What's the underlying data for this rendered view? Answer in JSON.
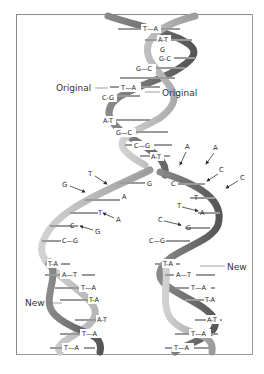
{
  "figure": {
    "labels": {
      "original_left": "Original",
      "original_right": "Original",
      "new_left": "New",
      "new_right": "New"
    },
    "parent_pairs": [
      "T—A",
      "A-T",
      "G",
      "G-C",
      "G—C",
      "T—A",
      "C-G",
      "A-T",
      "G—C",
      "C—G",
      "A-T"
    ],
    "fork_left_bases": [
      "G",
      "A",
      "T",
      "C"
    ],
    "fork_right_bases": [
      "C",
      "T",
      "A",
      "G"
    ],
    "free_nucleotides_left": [
      "T",
      "G",
      "A",
      "G"
    ],
    "free_nucleotides_right": [
      "A",
      "A",
      "C",
      "C",
      "T",
      "C"
    ],
    "left_daughter_pairs": [
      "C—G",
      "T-A",
      "A—T",
      "T—A",
      "T-A",
      "A-T",
      "T—A",
      "T—A"
    ],
    "right_daughter_pairs": [
      "C—G",
      "T-A",
      "A—T",
      "T—A",
      "T-A",
      "A-T",
      "T—A",
      "T—A"
    ],
    "colors": {
      "strand_light": "#b8b8b8",
      "strand_dark": "#6e6e6e",
      "rung": "#9a9a9a",
      "frame": "#8a8a8a",
      "text": "#333333"
    }
  }
}
